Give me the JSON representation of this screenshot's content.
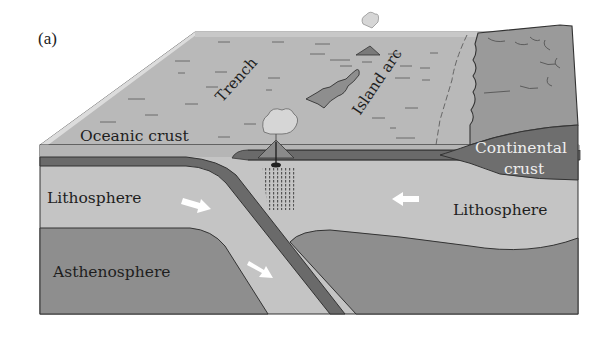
{
  "figure": {
    "panel_label": "(a)",
    "type": "block-diagram"
  },
  "labels": {
    "oceanic_crust": "Oceanic crust",
    "trench": "Trench",
    "island_arc": "Island arc",
    "continental_crust_line1": "Continental",
    "continental_crust_line2": "crust",
    "lithosphere_left": "Lithosphere",
    "lithosphere_right": "Lithosphere",
    "asthenosphere": "Asthenosphere"
  },
  "arrows": [
    {
      "name": "plate-motion-arrow-left-lithosphere",
      "direction": "down-right"
    },
    {
      "name": "slab-motion-arrow",
      "direction": "down-right"
    },
    {
      "name": "plate-motion-arrow-right-lithosphere",
      "direction": "left"
    }
  ],
  "colors": {
    "ocean_surface": "#b9b9b9",
    "ocean_edge_highlight": "#d9d9d9",
    "continental_top": "#9a9a9a",
    "continental_crust": "#6e6e6e",
    "lithosphere": "#c4c4c4",
    "asthenosphere": "#8e8e8e",
    "slab_band": "#6a6a6a",
    "outline": "#333333",
    "arrow": "#ffffff"
  }
}
